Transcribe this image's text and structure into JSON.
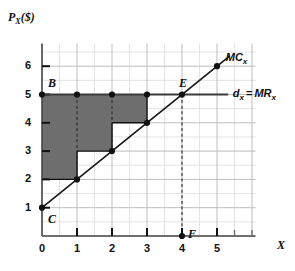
{
  "chart_data": {
    "type": "line",
    "title": "",
    "xlabel": "X",
    "ylabel": "P_X($)",
    "xlim": [
      0,
      6.1
    ],
    "ylim": [
      0,
      6.8
    ],
    "grid": true,
    "grid_minor_step": 0.5,
    "grid_major_step": 1,
    "legend_position": "inline-right",
    "xticks": [
      "0",
      "1",
      "2",
      "3",
      "4",
      "5"
    ],
    "xtick_values": [
      0,
      1,
      2,
      3,
      4,
      5
    ],
    "yticks": [
      "1",
      "2",
      "3",
      "4",
      "5",
      "6"
    ],
    "ytick_values": [
      1,
      2,
      3,
      4,
      5,
      6
    ],
    "series": [
      {
        "name": "MC_x",
        "label": "MC",
        "label_sub": "x",
        "type": "line",
        "equation": "P = 1 + X",
        "x": [
          0,
          5.35
        ],
        "y": [
          1,
          6.35
        ],
        "color": "#1a1a1a"
      },
      {
        "name": "d_x = MR_x",
        "label_left": "d",
        "label_left_sub": "x",
        "label_eq": "=",
        "label_right": "MR",
        "label_right_sub": "x",
        "type": "line",
        "equation": "P = 5",
        "x": [
          0,
          5.3
        ],
        "y": [
          5,
          5
        ],
        "color": "#3a3a3a"
      }
    ],
    "shaded_region": {
      "name": "producer-surplus-steps",
      "fill": "#6e6e6e",
      "description": "Staircase region between price line P=5 and the marginal cost steps",
      "vertices": [
        [
          0,
          2
        ],
        [
          1,
          2
        ],
        [
          1,
          3
        ],
        [
          2,
          3
        ],
        [
          2,
          4
        ],
        [
          3,
          4
        ],
        [
          3,
          5
        ],
        [
          0,
          5
        ]
      ]
    },
    "points": [
      {
        "name": "B",
        "label": "B",
        "x": 0,
        "y": 5,
        "label_dx": 6,
        "label_dy": -13
      },
      {
        "name": "p-1-5",
        "label": "",
        "x": 1,
        "y": 5
      },
      {
        "name": "p-2-5",
        "label": "",
        "x": 2,
        "y": 5
      },
      {
        "name": "p-3-5",
        "label": "",
        "x": 3,
        "y": 5
      },
      {
        "name": "E",
        "label": "E",
        "x": 4,
        "y": 5,
        "label_dx": -3,
        "label_dy": -13
      },
      {
        "name": "C",
        "label": "C",
        "x": 0,
        "y": 1,
        "label_dx": 6,
        "label_dy": 10
      },
      {
        "name": "mc-1-2",
        "label": "",
        "x": 1,
        "y": 2
      },
      {
        "name": "mc-2-3",
        "label": "",
        "x": 2,
        "y": 3
      },
      {
        "name": "mc-3-4",
        "label": "",
        "x": 3,
        "y": 4
      },
      {
        "name": "mc-5-6",
        "label": "",
        "x": 5,
        "y": 6
      },
      {
        "name": "F",
        "label": "F",
        "x": 4,
        "y": 0,
        "label_dx": 6,
        "label_dy": -3
      }
    ],
    "dashed_lines": [
      {
        "name": "drop-x1",
        "x1": 1,
        "y1": 5,
        "x2": 1,
        "y2": 2
      },
      {
        "name": "drop-x2",
        "x1": 2,
        "y1": 5,
        "x2": 2,
        "y2": 3
      },
      {
        "name": "quantity-line-EF",
        "x1": 4,
        "y1": 5,
        "x2": 4,
        "y2": 0
      }
    ],
    "step_outline": [
      {
        "name": "step-base",
        "x1": 0,
        "y1": 2,
        "x2": 1,
        "y2": 2
      },
      {
        "name": "step-riser-1",
        "x1": 1,
        "y1": 2,
        "x2": 1,
        "y2": 3
      },
      {
        "name": "step-tread-1",
        "x1": 1,
        "y1": 3,
        "x2": 2,
        "y2": 3
      },
      {
        "name": "step-riser-2",
        "x1": 2,
        "y1": 3,
        "x2": 2,
        "y2": 4
      },
      {
        "name": "step-tread-2",
        "x1": 2,
        "y1": 4,
        "x2": 3,
        "y2": 4
      },
      {
        "name": "step-riser-3",
        "x1": 3,
        "y1": 4,
        "x2": 3,
        "y2": 5
      }
    ]
  },
  "axes": {
    "y_label_main": "P",
    "y_label_sub": "X",
    "y_label_unit": "($)",
    "x_label": "X"
  }
}
